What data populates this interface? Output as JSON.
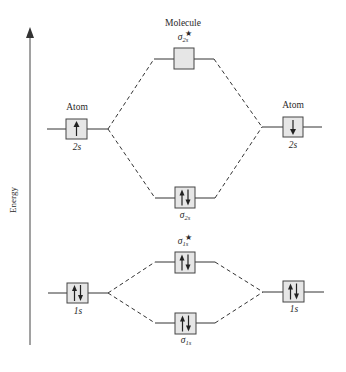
{
  "title": "Molecule",
  "axis": {
    "label": "Energy"
  },
  "atom_label_left": "Atom",
  "atom_label_right": "Atom",
  "orbitals": {
    "left_2s": {
      "label": "2s",
      "electrons": "up"
    },
    "right_2s": {
      "label": "2s",
      "electrons": "down"
    },
    "sigma_star_2s": {
      "symbol": "σ",
      "sub": "2s",
      "sup": "★",
      "electrons": "none"
    },
    "sigma_2s": {
      "symbol": "σ",
      "sub": "2s",
      "electrons": "paired"
    },
    "sigma_star_1s": {
      "symbol": "σ",
      "sub": "1s",
      "sup": "★",
      "electrons": "paired"
    },
    "sigma_1s": {
      "symbol": "σ",
      "sub": "1s",
      "electrons": "paired"
    },
    "left_1s": {
      "label": "1s",
      "electrons": "paired"
    },
    "right_1s": {
      "label": "1s",
      "electrons": "paired"
    }
  },
  "colors": {
    "box_fill": "#e6e6e6",
    "line": "#333333"
  }
}
